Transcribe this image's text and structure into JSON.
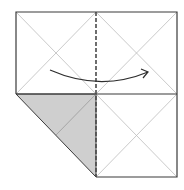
{
  "diagram": {
    "type": "origami-fold-step",
    "colors": {
      "background": "#ffffff",
      "edge": "#3a3a3a",
      "crease": "#bdbdbd",
      "valley_fold": "#4a4a4a",
      "paper_back": "#cfcfcf",
      "arrow": "#2e2e2e"
    },
    "square": {
      "left": 16,
      "top": 12,
      "right": 177,
      "bottom": 177,
      "mid_x": 96,
      "mid_y": 94
    },
    "folded_flap": {
      "points": "16,94 96,94 96,177",
      "inner_crease": "96,94 56,135"
    },
    "arrow": {
      "direction": "left-to-right",
      "path": "M50,70 Q100,92 148,72"
    }
  }
}
